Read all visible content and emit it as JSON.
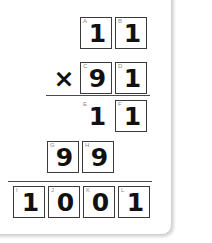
{
  "worksheet": {
    "type": "long-multiplication",
    "operator": "×",
    "rows": [
      {
        "name": "multiplicand",
        "cells": [
          {
            "label": "A",
            "digit": "1",
            "boxed": true
          },
          {
            "label": "B",
            "digit": "1",
            "boxed": true
          }
        ]
      },
      {
        "name": "multiplier",
        "operator": "×",
        "cells": [
          {
            "label": "C",
            "digit": "9",
            "boxed": true
          },
          {
            "label": "D",
            "digit": "1",
            "boxed": true
          }
        ]
      },
      {
        "name": "partial-product-1",
        "cells": [
          {
            "label": "E",
            "digit": "1",
            "boxed": false
          },
          {
            "label": "F",
            "digit": "1",
            "boxed": true
          }
        ]
      },
      {
        "name": "partial-product-2",
        "cells": [
          {
            "label": "G",
            "digit": "9",
            "boxed": true
          },
          {
            "label": "H",
            "digit": "9",
            "boxed": true
          }
        ]
      },
      {
        "name": "product",
        "cells": [
          {
            "label": "I",
            "digit": "1",
            "boxed": true
          },
          {
            "label": "J",
            "digit": "0",
            "boxed": true
          },
          {
            "label": "K",
            "digit": "0",
            "boxed": true
          },
          {
            "label": "L",
            "digit": "1",
            "boxed": true
          }
        ]
      }
    ]
  },
  "colors": {
    "digit": "#111111",
    "box_border": "#3b3b3b",
    "rule": "#4a4a4a",
    "label": "#8a8a8a",
    "background": "#ffffff",
    "card_border": "#cfcfcf"
  }
}
